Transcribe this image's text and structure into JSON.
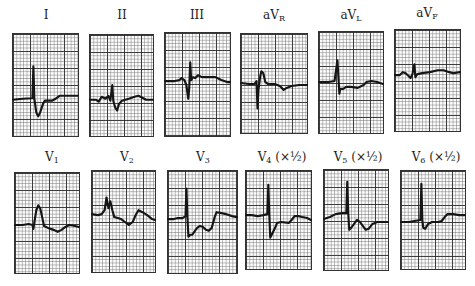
{
  "figure": {
    "type": "12-lead ECG strips",
    "rows": [
      {
        "leads": [
          {
            "id": "I",
            "label": "I",
            "sub": "",
            "suffix": ""
          },
          {
            "id": "II",
            "label": "II",
            "sub": "",
            "suffix": ""
          },
          {
            "id": "III",
            "label": "III",
            "sub": "",
            "suffix": ""
          },
          {
            "id": "aVR",
            "label": "aV",
            "sub": "R",
            "suffix": ""
          },
          {
            "id": "aVL",
            "label": "aV",
            "sub": "L",
            "suffix": ""
          },
          {
            "id": "aVF",
            "label": "aV",
            "sub": "F",
            "suffix": ""
          }
        ]
      },
      {
        "leads": [
          {
            "id": "V1",
            "label": "V",
            "sub": "1",
            "suffix": ""
          },
          {
            "id": "V2",
            "label": "V",
            "sub": "2",
            "suffix": ""
          },
          {
            "id": "V3",
            "label": "V",
            "sub": "3",
            "suffix": ""
          },
          {
            "id": "V4",
            "label": "V",
            "sub": "4",
            "suffix": " (×½)"
          },
          {
            "id": "V5",
            "label": "V",
            "sub": "5",
            "suffix": " (×½)"
          },
          {
            "id": "V6",
            "label": "V",
            "sub": "6",
            "suffix": " (×½)"
          }
        ]
      }
    ],
    "colors": {
      "trace": "#151515",
      "grid_major": "#282828",
      "grid_minor": "#5a5a5a",
      "paper": "#fbfbfb"
    }
  }
}
